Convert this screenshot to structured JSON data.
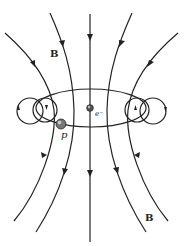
{
  "diagram": {
    "labels": {
      "field_top": "B",
      "field_bottom": "B",
      "electron": "e⁻",
      "proton": "p"
    },
    "colors": {
      "line": "#222222",
      "background": "#ffffff",
      "particle": "#777777"
    }
  }
}
